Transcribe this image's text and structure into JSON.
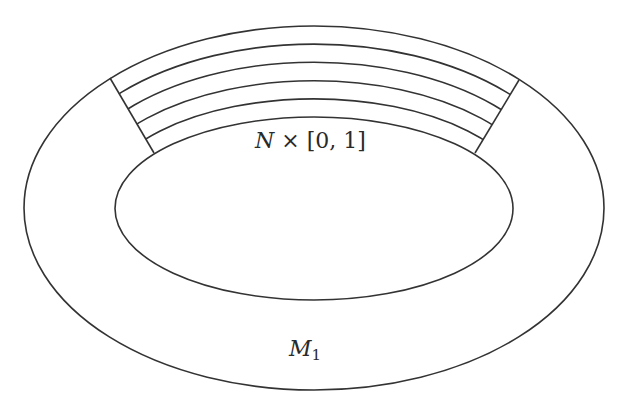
{
  "diagram": {
    "type": "annulus-with-collar",
    "stroke_color": "#333333",
    "background": "#ffffff",
    "labels": {
      "collar": {
        "N": "N",
        "times": " × [0, 1]"
      },
      "region": {
        "M": "M",
        "sub": "1"
      }
    },
    "outer_ellipse": {
      "cx": 314,
      "cy": 208,
      "rx": 290,
      "ry": 182
    },
    "inner_ellipse": {
      "cx": 314,
      "cy": 208.5,
      "rx": 199,
      "ry": 91.5
    },
    "collar_curve_count": 6,
    "radial_lines": [
      {
        "x1": 110,
        "y1": 78,
        "x2": 154,
        "y2": 153
      },
      {
        "x1": 519,
        "y1": 80,
        "x2": 475,
        "y2": 153
      }
    ]
  }
}
